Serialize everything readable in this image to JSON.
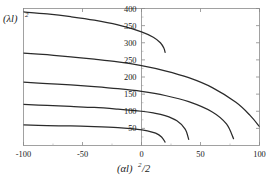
{
  "figure": {
    "background_color": "#ffffff",
    "curve_color": "#2b2b2b",
    "frame_color": "#8a8a8a",
    "text_color": "#1a1a1a"
  },
  "labels": {
    "ylabel": "(λl)²",
    "ylabel_base": "(λl)",
    "ylabel_exp": "2",
    "xlabel": "(αl)²/2",
    "xlabel_base": "(αl)",
    "xlabel_exp": "2",
    "xlabel_tail": "/2"
  },
  "chart_data": {
    "type": "line",
    "title": "",
    "xlabel": "(αl)²/2",
    "ylabel": "(λl)²",
    "xlim": [
      -100,
      100
    ],
    "ylim": [
      0,
      400
    ],
    "xticks": [
      -100,
      -50,
      0,
      50,
      100
    ],
    "xticklabels": [
      "-100",
      "-50",
      "0",
      "50",
      "100"
    ],
    "yticks": [
      50,
      100,
      150,
      200,
      250,
      300,
      350,
      400
    ],
    "yticklabels": [
      "50",
      "100",
      "150",
      "200",
      "250",
      "300",
      "350",
      "400"
    ],
    "grid": false,
    "legend": false,
    "yaxis_position": 0,
    "xminorticks": [
      -75,
      -25,
      25,
      75
    ],
    "yminorticks": [
      25,
      75,
      125,
      175,
      225,
      275,
      325,
      375
    ],
    "series": [
      {
        "name": "contour-1",
        "x": [
          -100,
          -80,
          -60,
          -40,
          -20,
          0,
          10,
          16,
          19,
          20
        ],
        "y": [
          390,
          384,
          376,
          366,
          352,
          332,
          316,
          300,
          284,
          272
        ]
      },
      {
        "name": "contour-2",
        "x": [
          -100,
          -80,
          -60,
          -40,
          -20,
          0,
          20,
          40,
          60,
          80,
          92,
          100
        ],
        "y": [
          270,
          265,
          259,
          252,
          244,
          233,
          218,
          198,
          169,
          126,
          88,
          55
        ]
      },
      {
        "name": "contour-3",
        "x": [
          -100,
          -80,
          -60,
          -40,
          -20,
          0,
          20,
          40,
          60,
          72,
          78
        ],
        "y": [
          185,
          181,
          177,
          172,
          166,
          158,
          146,
          128,
          98,
          63,
          20
        ]
      },
      {
        "name": "contour-4",
        "x": [
          -100,
          -80,
          -60,
          -40,
          -20,
          0,
          10,
          20,
          30,
          37,
          40
        ],
        "y": [
          120,
          117,
          114,
          111,
          106,
          100,
          95,
          87,
          72,
          48,
          18
        ]
      },
      {
        "name": "contour-5",
        "x": [
          -100,
          -80,
          -60,
          -40,
          -20,
          -5,
          5,
          12,
          17,
          20
        ],
        "y": [
          60,
          58,
          57,
          55,
          52,
          48,
          43,
          36,
          25,
          10
        ]
      }
    ]
  }
}
